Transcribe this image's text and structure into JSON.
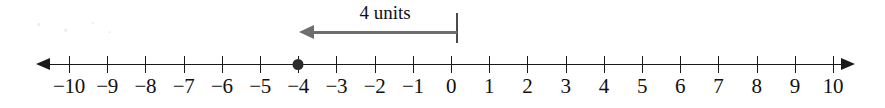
{
  "figure": {
    "type": "number-line",
    "colors": {
      "line": "#1a1a1a",
      "label": "#111111",
      "point": "#2b2b2b",
      "annotation_arrow": "#6e6e6e",
      "annotation_rule": "#4b4b4b",
      "background": "#ffffff"
    }
  },
  "chart_data": {
    "type": "number-line",
    "title": "",
    "xlabel": "",
    "ylabel": "",
    "xlim": [
      -10,
      10
    ],
    "tick_step": 1,
    "grid": false,
    "legend": false,
    "ticks": [
      -10,
      -9,
      -8,
      -7,
      -6,
      -5,
      -4,
      -3,
      -2,
      -1,
      0,
      1,
      2,
      3,
      4,
      5,
      6,
      7,
      8,
      9,
      10
    ],
    "tick_labels": [
      "−10",
      "−9",
      "−8",
      "−7",
      "−6",
      "−5",
      "−4",
      "−3",
      "−2",
      "−1",
      "0",
      "1",
      "2",
      "3",
      "4",
      "5",
      "6",
      "7",
      "8",
      "9",
      "10"
    ],
    "axis_arrows": {
      "left": true,
      "right": true
    },
    "points": [
      {
        "value": -4,
        "label": "−4",
        "style": "filled-dot"
      }
    ],
    "annotations": [
      {
        "text": "4 units",
        "from": 0,
        "to": -4,
        "direction": "left",
        "magnitude": 4,
        "unit": "units",
        "style": "arrow-with-end-rule"
      }
    ]
  },
  "annotation": {
    "label": "4 units"
  }
}
